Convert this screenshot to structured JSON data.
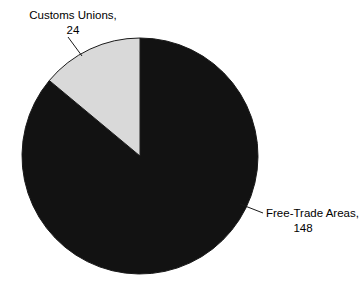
{
  "chart_data": {
    "type": "pie",
    "title": "",
    "subtitle": "",
    "xlabel": "",
    "ylabel": "",
    "legend_position": "none",
    "grid": false,
    "total": 172,
    "categories": [
      "Free-Trade Areas",
      "Customs Unions"
    ],
    "values": [
      148,
      24
    ],
    "slices": [
      {
        "name": "Free-Trade Areas",
        "value": 148,
        "percent": 86.05,
        "color": "#121212",
        "label_line1": "Free-Trade Areas,",
        "label_line2": "148"
      },
      {
        "name": "Customs Unions",
        "value": 24,
        "percent": 13.95,
        "color": "#d9d9d9",
        "label_line1": "Customs Unions,",
        "label_line2": "24"
      }
    ]
  },
  "colors": {
    "background": "#ffffff",
    "outline": "#1a1a1a",
    "text": "#000000",
    "slice_free_trade": "#121212",
    "slice_customs_unions": "#d9d9d9"
  },
  "geometry": {
    "center_x": 140,
    "center_y": 156,
    "radius": 118,
    "start_angle_deg": 0
  }
}
